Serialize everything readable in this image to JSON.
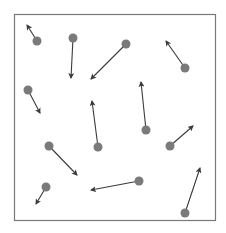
{
  "diagram": {
    "type": "vector-field-particles",
    "frame": {
      "x": 14,
      "y": 14,
      "width": 201,
      "height": 206,
      "stroke": "#7a7a7a"
    },
    "colors": {
      "dot": "#7a7a7a",
      "arrow": "#3a3a3a",
      "background": "#ffffff"
    },
    "particles": [
      {
        "id": 1,
        "x": 37,
        "y": 41,
        "tx": 27,
        "ty": 25
      },
      {
        "id": 2,
        "x": 73,
        "y": 38,
        "tx": 71,
        "ty": 78
      },
      {
        "id": 3,
        "x": 126,
        "y": 44,
        "tx": 91,
        "ty": 79
      },
      {
        "id": 4,
        "x": 185,
        "y": 68,
        "tx": 166,
        "ty": 41
      },
      {
        "id": 5,
        "x": 28,
        "y": 90,
        "tx": 40,
        "ty": 113
      },
      {
        "id": 6,
        "x": 98,
        "y": 147,
        "tx": 92,
        "ty": 101
      },
      {
        "id": 7,
        "x": 146,
        "y": 130,
        "tx": 141,
        "ty": 82
      },
      {
        "id": 8,
        "x": 170,
        "y": 146,
        "tx": 193,
        "ty": 126
      },
      {
        "id": 9,
        "x": 49,
        "y": 146,
        "tx": 77,
        "ty": 175
      },
      {
        "id": 10,
        "x": 139,
        "y": 181,
        "tx": 91,
        "ty": 190
      },
      {
        "id": 11,
        "x": 46,
        "y": 187,
        "tx": 36,
        "ty": 204
      },
      {
        "id": 12,
        "x": 185,
        "y": 213,
        "tx": 200,
        "ty": 168
      }
    ]
  }
}
